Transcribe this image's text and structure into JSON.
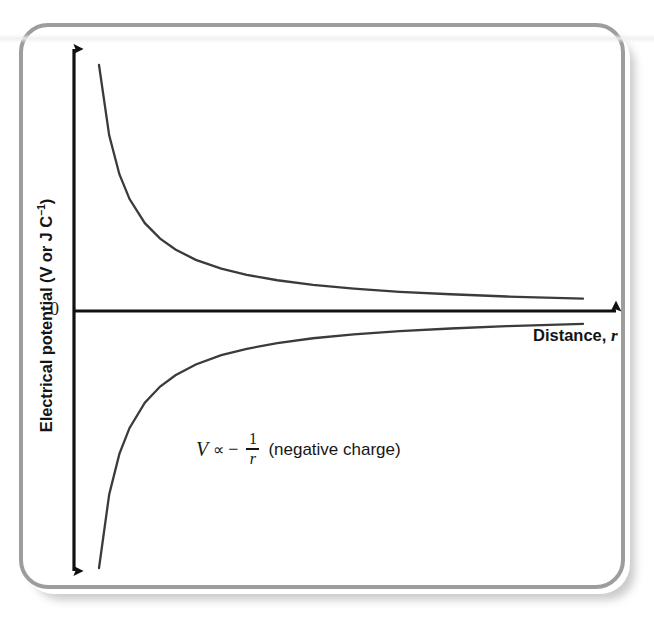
{
  "figure": {
    "frame_color": "#9d9d9d",
    "background": "#ffffff",
    "axis_color": "#111111",
    "curve_color": "#3b3b3b"
  },
  "axes": {
    "y_title_main": "Electrical potential (V or J C",
    "y_title_sup": "−1",
    "y_title_close": ")",
    "x_title_main": "Distance,",
    "x_title_var": "r",
    "zero_label": "0"
  },
  "annotation": {
    "variable": "V",
    "proportional": "∝",
    "minus": "−",
    "numerator": "1",
    "denominator": "r",
    "trailing": "(negative charge)"
  },
  "chart_data": {
    "type": "line",
    "title": "",
    "subtitle": "",
    "xlabel": "Distance, r",
    "ylabel": "Electrical potential (V or J C⁻¹)",
    "xlim": [
      0,
      1
    ],
    "ylim": [
      -1,
      1
    ],
    "grid": false,
    "legend": "none",
    "xticks": [],
    "yticks": [
      0
    ],
    "ytick_labels": [
      "0"
    ],
    "annotations": [
      {
        "text": "V ∝ − 1/r (negative charge)",
        "x": 0.25,
        "y": -0.36
      }
    ],
    "series": [
      {
        "name": "V ∝ 1/r (positive charge)",
        "equation": "V = k/r",
        "color": "#3b3b3b",
        "x": [
          0.05,
          0.07,
          0.09,
          0.11,
          0.14,
          0.17,
          0.2,
          0.24,
          0.29,
          0.34,
          0.4,
          0.47,
          0.55,
          0.64,
          0.74,
          0.85,
          1.0
        ],
        "y": [
          1.0,
          0.714,
          0.556,
          0.455,
          0.357,
          0.294,
          0.25,
          0.208,
          0.172,
          0.147,
          0.125,
          0.106,
          0.091,
          0.078,
          0.068,
          0.059,
          0.05
        ]
      },
      {
        "name": "V ∝ −1/r (negative charge)",
        "equation": "V = −k/r",
        "color": "#3b3b3b",
        "x": [
          0.05,
          0.07,
          0.09,
          0.11,
          0.14,
          0.17,
          0.2,
          0.24,
          0.29,
          0.34,
          0.4,
          0.47,
          0.55,
          0.64,
          0.74,
          0.85,
          1.0
        ],
        "y": [
          -1.0,
          -0.714,
          -0.556,
          -0.455,
          -0.357,
          -0.294,
          -0.25,
          -0.208,
          -0.172,
          -0.147,
          -0.125,
          -0.106,
          -0.091,
          -0.078,
          -0.068,
          -0.059,
          -0.05
        ]
      }
    ]
  }
}
